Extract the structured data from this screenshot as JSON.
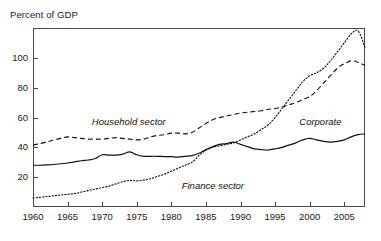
{
  "figure": {
    "axis_title": "Percent of GDP"
  },
  "chart_data": {
    "type": "line",
    "title": "",
    "subtitle": "",
    "xlabel": "",
    "ylabel": "Percent of GDP",
    "xlim": [
      1960,
      2008
    ],
    "ylim": [
      0,
      120
    ],
    "grid": false,
    "legend_position": "inline-annotations",
    "xticks": [
      "1960",
      "1965",
      "1970",
      "1975",
      "1980",
      "1985",
      "1990",
      "1995",
      "2000",
      "2005"
    ],
    "xtick_values": [
      1960,
      1965,
      1970,
      1975,
      1980,
      1985,
      1990,
      1995,
      2000,
      2005
    ],
    "yticks": [
      "20",
      "40",
      "60",
      "80",
      "100"
    ],
    "ytick_values": [
      20,
      40,
      60,
      80,
      100
    ],
    "annotations": [
      {
        "text": "Household sector",
        "x": 1968.5,
        "y": 57
      },
      {
        "text": "Finance sector",
        "x": 1981.5,
        "y": 14
      },
      {
        "text": "Corporate",
        "x": 1998.5,
        "y": 57
      }
    ],
    "x": [
      1960,
      1961,
      1962,
      1963,
      1964,
      1965,
      1966,
      1967,
      1968,
      1969,
      1970,
      1971,
      1972,
      1973,
      1974,
      1975,
      1976,
      1977,
      1978,
      1979,
      1980,
      1981,
      1982,
      1983,
      1984,
      1985,
      1986,
      1987,
      1988,
      1989,
      1990,
      1991,
      1992,
      1993,
      1994,
      1995,
      1996,
      1997,
      1998,
      1999,
      2000,
      2001,
      2002,
      2003,
      2004,
      2005,
      2006,
      2007,
      2008
    ],
    "series": [
      {
        "name": "Corporate",
        "style": "solid",
        "values": [
          28,
          28,
          28.2,
          28.5,
          29,
          29.5,
          30.2,
          31,
          31.5,
          32.5,
          35,
          34.8,
          34.8,
          35.5,
          37,
          35,
          34,
          34,
          34,
          33.8,
          33.8,
          33.5,
          34,
          34.5,
          36,
          38.5,
          40.5,
          42,
          42.5,
          43.5,
          42,
          40.5,
          39,
          38.5,
          38.2,
          39,
          40,
          41.5,
          43,
          45,
          46,
          45,
          44,
          43.5,
          44,
          45,
          47,
          48.5,
          49
        ]
      },
      {
        "name": "Household sector",
        "style": "dashed",
        "values": [
          41.5,
          42.5,
          43.5,
          45,
          46,
          47,
          46.5,
          46,
          45.5,
          45.5,
          45.5,
          46,
          46.5,
          46,
          45.5,
          45,
          45.5,
          47,
          48,
          48.5,
          49.5,
          49.5,
          49,
          50,
          53,
          56,
          58.5,
          60,
          61,
          62,
          63,
          63.5,
          64,
          64.5,
          65.5,
          66,
          67,
          68.5,
          70,
          72,
          74,
          78,
          83,
          88,
          93,
          96,
          98,
          97,
          95
        ]
      },
      {
        "name": "Finance sector",
        "style": "dotted",
        "values": [
          6,
          6.5,
          7,
          7.5,
          8,
          8.5,
          9,
          10,
          11,
          12,
          13,
          14,
          15.5,
          17,
          17.8,
          17.5,
          18,
          19,
          20.5,
          22,
          24,
          26,
          28,
          30,
          34.5,
          38,
          40,
          41,
          42,
          43,
          45,
          47,
          49,
          52,
          55,
          60,
          66,
          72,
          78,
          84,
          88,
          90,
          93,
          98,
          104,
          110,
          116,
          118,
          107
        ]
      }
    ]
  }
}
